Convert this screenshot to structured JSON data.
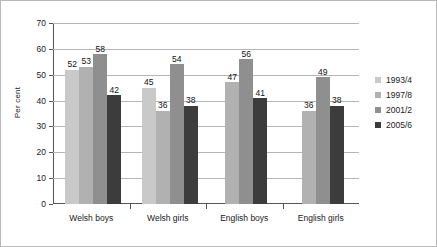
{
  "chart_data": {
    "type": "bar",
    "title": "",
    "xlabel": "",
    "ylabel": "Per cent",
    "ylim": [
      0,
      70
    ],
    "yticks": [
      0,
      10,
      20,
      30,
      40,
      50,
      60,
      70
    ],
    "grid": true,
    "legend_position": "right",
    "categories": [
      "Welsh boys",
      "Welsh girls",
      "English boys",
      "English girls"
    ],
    "series": [
      {
        "name": "1993/4",
        "color": "#c9c9c9",
        "values": [
          52,
          45,
          null,
          null
        ]
      },
      {
        "name": "1997/8",
        "color": "#b1b1b1",
        "values": [
          53,
          36,
          47,
          36
        ]
      },
      {
        "name": "2001/2",
        "color": "#8f8f8f",
        "values": [
          58,
          54,
          56,
          49
        ]
      },
      {
        "name": "2005/6",
        "color": "#3c3c3c",
        "values": [
          42,
          38,
          41,
          38
        ]
      }
    ]
  }
}
